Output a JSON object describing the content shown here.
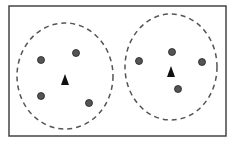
{
  "diagram": {
    "frame": {
      "x": 9,
      "y": 6,
      "width": 217,
      "height": 130,
      "stroke": "#444444"
    },
    "clusters": [
      {
        "name": "cluster-1",
        "boundary": {
          "cx": 65,
          "cy": 76,
          "rx": 48,
          "ry": 53
        },
        "centroid": {
          "x": 65,
          "y": 80
        },
        "points": [
          {
            "x": 41,
            "y": 60
          },
          {
            "x": 76,
            "y": 53
          },
          {
            "x": 41,
            "y": 96
          },
          {
            "x": 89,
            "y": 103
          }
        ]
      },
      {
        "name": "cluster-2",
        "boundary": {
          "cx": 171,
          "cy": 67,
          "rx": 46,
          "ry": 53
        },
        "centroid": {
          "x": 171,
          "y": 72
        },
        "points": [
          {
            "x": 139,
            "y": 61
          },
          {
            "x": 172,
            "y": 52
          },
          {
            "x": 202,
            "y": 62
          },
          {
            "x": 178,
            "y": 89
          }
        ]
      }
    ],
    "colors": {
      "point": "#555555",
      "point_stroke": "#222222",
      "centroid": "#111111",
      "boundary": "#555555"
    }
  }
}
